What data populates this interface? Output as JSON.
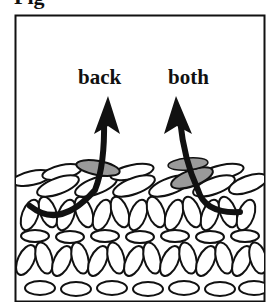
{
  "figure": {
    "caption": "Fig",
    "labels": {
      "left": "back",
      "right": "both"
    },
    "colors": {
      "outline": "#111111",
      "highlight": "#9a9a9a",
      "background": "#ffffff"
    }
  }
}
